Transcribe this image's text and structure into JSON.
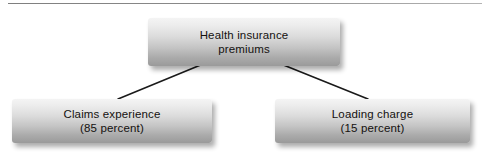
{
  "diagram": {
    "type": "tree",
    "title_rule": "horizontal-rule",
    "nodes": [
      {
        "id": "root",
        "line1": "Health insurance",
        "line2": "premiums"
      },
      {
        "id": "left",
        "line1": "Claims experience",
        "line2": "(85 percent)",
        "percent": 85
      },
      {
        "id": "right",
        "line1": "Loading charge",
        "line2": "(15 percent)",
        "percent": 15
      }
    ],
    "edges": [
      {
        "from": "root",
        "to": "left"
      },
      {
        "from": "root",
        "to": "right"
      }
    ],
    "colors": {
      "box_gradient_top": "#f4f4f4",
      "box_gradient_bottom": "#9a9a9a",
      "text": "#14110f",
      "connector": "#1a1a1a",
      "background": "#ffffff"
    }
  }
}
